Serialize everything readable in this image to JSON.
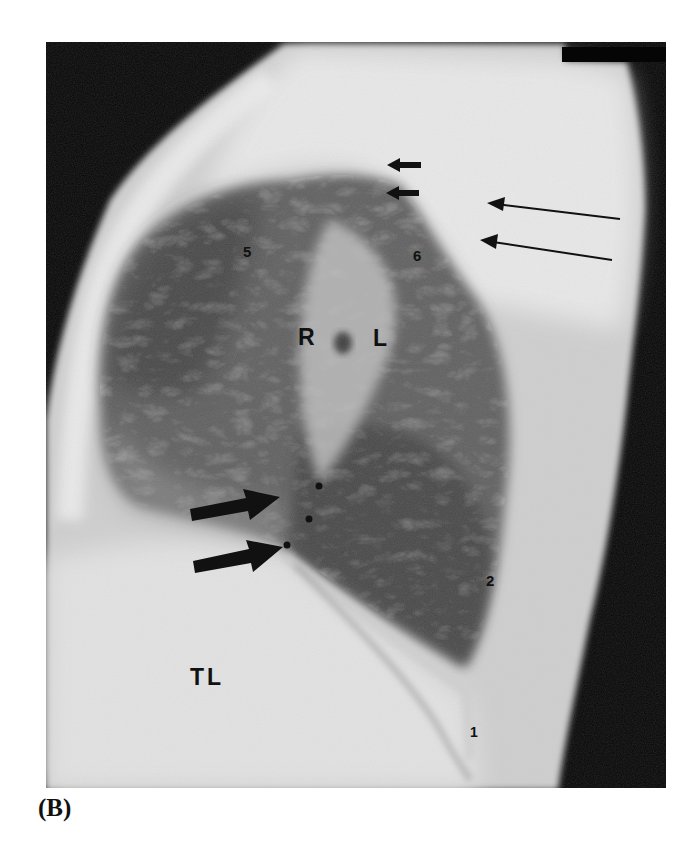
{
  "figure": {
    "panel_label": "(B)",
    "colors": {
      "background": "#ffffff",
      "film_black": "#050505",
      "soft_tissue": "#d9d9d9",
      "lung_dark": "#5e5e5e",
      "annotation": "#111111"
    },
    "labels": {
      "right_hilum": "R",
      "left_hilum": "L",
      "region_5": "5",
      "region_6": "6",
      "region_2": "2",
      "region_1": "1",
      "tl": "TL"
    },
    "arrows": {
      "short_arrows": [
        {
          "name": "short-arrow-upper",
          "from": [
            421,
            165
          ],
          "to": [
            387,
            165
          ]
        },
        {
          "name": "short-arrow-lower",
          "from": [
            419,
            193
          ],
          "to": [
            386,
            193
          ]
        }
      ],
      "long_thin_arrows": [
        {
          "name": "long-arrow-upper",
          "from": [
            620,
            219
          ],
          "to": [
            487,
            203
          ]
        },
        {
          "name": "long-arrow-lower",
          "from": [
            612,
            260
          ],
          "to": [
            480,
            240
          ]
        }
      ],
      "thick_arrows": [
        {
          "name": "thick-arrow-upper",
          "from": [
            190,
            514
          ],
          "to": [
            280,
            497
          ]
        },
        {
          "name": "thick-arrow-lower",
          "from": [
            193,
            566
          ],
          "to": [
            283,
            547
          ]
        }
      ],
      "dots": [
        [
          319,
          486
        ],
        [
          309,
          519
        ],
        [
          287,
          545
        ]
      ]
    }
  }
}
